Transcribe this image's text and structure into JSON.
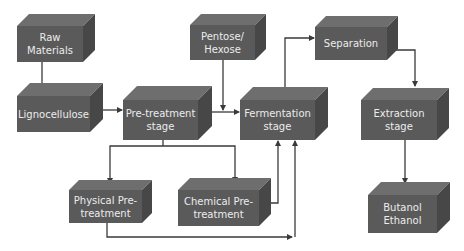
{
  "diagram": {
    "type": "process-flow",
    "colors": {
      "box_front": "#5a5a5a",
      "box_top": "#6e6e6e",
      "box_side": "#474747",
      "box_text": "#ececec",
      "arrow": "#3a3a3a",
      "background": "#ffffff"
    },
    "nodes": [
      {
        "id": "raw_materials",
        "label": "Raw Materials",
        "line1": "Raw",
        "line2": "Materials"
      },
      {
        "id": "lignocellulose",
        "label": "Lignocellulose",
        "line1": "Lignocellulose",
        "line2": ""
      },
      {
        "id": "pretreatment",
        "label": "Pre-treatment stage",
        "line1": "Pre-treatment",
        "line2": "stage"
      },
      {
        "id": "pentose_hexose",
        "label": "Pentose/ Hexose",
        "line1": "Pentose/",
        "line2": "Hexose"
      },
      {
        "id": "fermentation",
        "label": "Fermentation stage",
        "line1": "Fermentation",
        "line2": "stage"
      },
      {
        "id": "separation",
        "label": "Separation",
        "line1": "Separation",
        "line2": ""
      },
      {
        "id": "extraction",
        "label": "Extraction stage",
        "line1": "Extraction",
        "line2": "stage"
      },
      {
        "id": "physical",
        "label": "Physical Pre-treatment",
        "line1": "Physical Pre-",
        "line2": "treatment"
      },
      {
        "id": "chemical",
        "label": "Chemical Pre-treatment",
        "line1": "Chemical Pre-",
        "line2": "treatment"
      },
      {
        "id": "products",
        "label": "Butanol Ethanol",
        "line1": "Butanol",
        "line2": "Ethanol"
      }
    ],
    "edges": [
      {
        "from": "raw_materials",
        "to": "lignocellulose"
      },
      {
        "from": "lignocellulose",
        "to": "pretreatment"
      },
      {
        "from": "pretreatment",
        "to": "fermentation"
      },
      {
        "from": "pentose_hexose",
        "to": "fermentation"
      },
      {
        "from": "pretreatment",
        "to": "physical"
      },
      {
        "from": "pretreatment",
        "to": "chemical"
      },
      {
        "from": "chemical",
        "to": "fermentation"
      },
      {
        "from": "physical",
        "to": "fermentation"
      },
      {
        "from": "fermentation",
        "to": "separation"
      },
      {
        "from": "separation",
        "to": "extraction"
      },
      {
        "from": "extraction",
        "to": "products"
      }
    ]
  }
}
